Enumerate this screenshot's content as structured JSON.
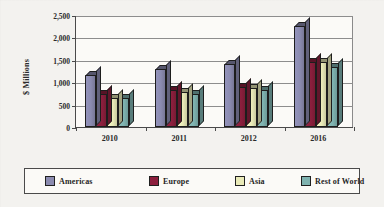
{
  "chart_data": {
    "type": "bar",
    "title": "",
    "xlabel": "",
    "ylabel": "$ Millions",
    "categories": [
      "2010",
      "2011",
      "2012",
      "2016"
    ],
    "ylim": [
      0,
      2500
    ],
    "yticks": [
      0,
      500,
      1000,
      1500,
      2000,
      2500
    ],
    "ytick_labels": [
      "0",
      "500",
      "1,000",
      "1,500",
      "2,000",
      "2,500"
    ],
    "grid": true,
    "legend_position": "bottom",
    "series": [
      {
        "name": "Americas",
        "color": "#8b8bb0",
        "values": [
          1150,
          1300,
          1400,
          2250
        ]
      },
      {
        "name": "Europe",
        "color": "#8c1f3d",
        "values": [
          730,
          830,
          900,
          1450
        ]
      },
      {
        "name": "Asia",
        "color": "#e9eab8",
        "values": [
          640,
          780,
          880,
          1450
        ]
      },
      {
        "name": "Rest of World",
        "color": "#7fb3b0",
        "values": [
          640,
          740,
          830,
          1350
        ]
      }
    ]
  },
  "legend": {
    "items": [
      {
        "label": "Americas"
      },
      {
        "label": "Europe"
      },
      {
        "label": "Asia"
      },
      {
        "label": "Rest of World"
      }
    ]
  }
}
